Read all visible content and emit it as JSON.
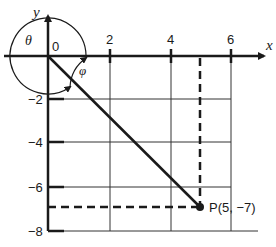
{
  "diagram": {
    "type": "coordinate-plane",
    "axes": {
      "x_label": "x",
      "y_label": "y",
      "origin_label": "0",
      "x_ticks": [
        "2",
        "4",
        "6"
      ],
      "y_ticks": [
        "-2",
        "-4",
        "-6",
        "-8"
      ],
      "y_tick_display": [
        "−2",
        "−4",
        "−6",
        "−8"
      ]
    },
    "angles": {
      "theta_label": "θ",
      "phi_label": "φ"
    },
    "point": {
      "label": "P(5, −7)",
      "x": 5,
      "y": -7
    },
    "colors": {
      "ink": "#1a1a1a",
      "grid": "#333333",
      "background": "#ffffff"
    }
  }
}
